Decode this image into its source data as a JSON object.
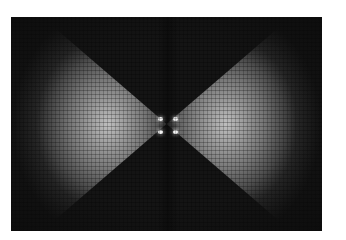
{
  "image": {
    "description": "Grayscale bowtie-shaped diffraction/intensity pattern on dark background",
    "colors": {
      "background": "#141414",
      "lobe_peak": "#dcdcdc",
      "page": "#ffffff"
    },
    "bright_spots": [
      {
        "x": 158,
        "y": 117
      },
      {
        "x": 173,
        "y": 117
      },
      {
        "x": 158,
        "y": 130
      },
      {
        "x": 173,
        "y": 130
      }
    ]
  }
}
